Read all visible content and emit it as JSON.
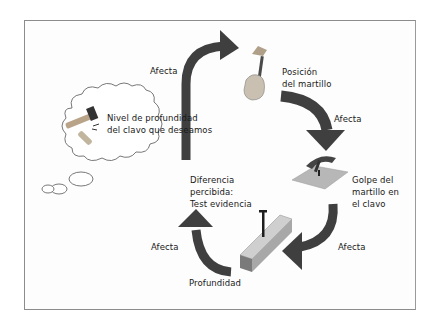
{
  "diagram": {
    "type": "feedback-loop",
    "colors": {
      "arrow": "#3f3f3f",
      "frame": "#8c8c8c",
      "text": "#1a1a1a",
      "wood": "#b5b5b5"
    },
    "thought_bubble": {
      "icon": "hammer-and-nails-icon",
      "text_line1": "Nivel de profundidad",
      "text_line2": "del clavo que deseamos"
    },
    "nodes": {
      "hammer_position": {
        "icon": "hand-holding-hammer-icon",
        "line1": "Posición",
        "line2": "del martillo"
      },
      "hammer_strike": {
        "icon": "hammer-striking-nail-icon",
        "line1": "Golpe del",
        "line2": "martillo en",
        "line3": "el clavo"
      },
      "depth": {
        "icon": "nail-in-wood-block-icon",
        "label": "Profundidad"
      },
      "perceived_difference": {
        "line1": "Diferencia",
        "line2": "percibida:",
        "line3": "Test evidencia"
      }
    },
    "edges": [
      {
        "label": "Afecta",
        "from": "thought_bubble",
        "to": "hammer_position"
      },
      {
        "label": "Afecta",
        "from": "hammer_position",
        "to": "hammer_strike"
      },
      {
        "label": "Afecta",
        "from": "hammer_strike",
        "to": "depth"
      },
      {
        "label": "Afecta",
        "from": "depth",
        "to": "perceived_difference"
      }
    ]
  }
}
